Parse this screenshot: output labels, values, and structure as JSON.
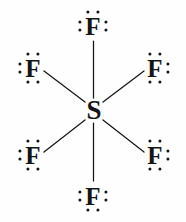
{
  "diagram": {
    "molecule_formula": "SF6",
    "background_color": "#fefefe",
    "ink_color": "#151515",
    "width": 186,
    "height": 222,
    "center_atom": {
      "symbol": "S",
      "name": "sulfur",
      "x": 94,
      "y": 110,
      "lone_pairs": 0,
      "bonds": 6
    },
    "terminal_atoms": [
      {
        "id": "fluorine-top",
        "symbol": "F",
        "name": "fluorine",
        "x": 93,
        "y": 26,
        "lone_pair_sides": [
          "top",
          "left",
          "right"
        ]
      },
      {
        "id": "fluorine-top-left",
        "symbol": "F",
        "name": "fluorine",
        "x": 33,
        "y": 68,
        "lone_pair_sides": [
          "top",
          "left",
          "bottom"
        ]
      },
      {
        "id": "fluorine-top-right",
        "symbol": "F",
        "name": "fluorine",
        "x": 155,
        "y": 68,
        "lone_pair_sides": [
          "top",
          "right",
          "bottom"
        ]
      },
      {
        "id": "fluorine-bottom-left",
        "symbol": "F",
        "name": "fluorine",
        "x": 33,
        "y": 155,
        "lone_pair_sides": [
          "top",
          "left",
          "bottom"
        ]
      },
      {
        "id": "fluorine-bottom-right",
        "symbol": "F",
        "name": "fluorine",
        "x": 155,
        "y": 155,
        "lone_pair_sides": [
          "top",
          "right",
          "bottom"
        ]
      },
      {
        "id": "fluorine-bottom",
        "symbol": "F",
        "name": "fluorine",
        "x": 93,
        "y": 196,
        "lone_pair_sides": [
          "left",
          "right",
          "bottom"
        ]
      }
    ],
    "bonds": [
      {
        "id": "bond-s-f-top",
        "from": "S",
        "to": "fluorine-top",
        "order": 1,
        "x1": 93.5,
        "y1": 98,
        "x2": 93.5,
        "y2": 41
      },
      {
        "id": "bond-s-f-top-left",
        "from": "S",
        "to": "fluorine-top-left",
        "order": 1,
        "x1": 85,
        "y1": 102,
        "x2": 44,
        "y2": 71
      },
      {
        "id": "bond-s-f-top-right",
        "from": "S",
        "to": "fluorine-top-right",
        "order": 1,
        "x1": 103,
        "y1": 102,
        "x2": 144,
        "y2": 71
      },
      {
        "id": "bond-s-f-bottom-left",
        "from": "S",
        "to": "fluorine-bottom-left",
        "order": 1,
        "x1": 85,
        "y1": 120,
        "x2": 44,
        "y2": 152
      },
      {
        "id": "bond-s-f-bottom-right",
        "from": "S",
        "to": "fluorine-bottom-right",
        "order": 1,
        "x1": 103,
        "y1": 120,
        "x2": 144,
        "y2": 152
      },
      {
        "id": "bond-s-f-bottom",
        "from": "S",
        "to": "fluorine-bottom",
        "order": 1,
        "x1": 93.5,
        "y1": 123,
        "x2": 93.5,
        "y2": 181
      }
    ]
  }
}
